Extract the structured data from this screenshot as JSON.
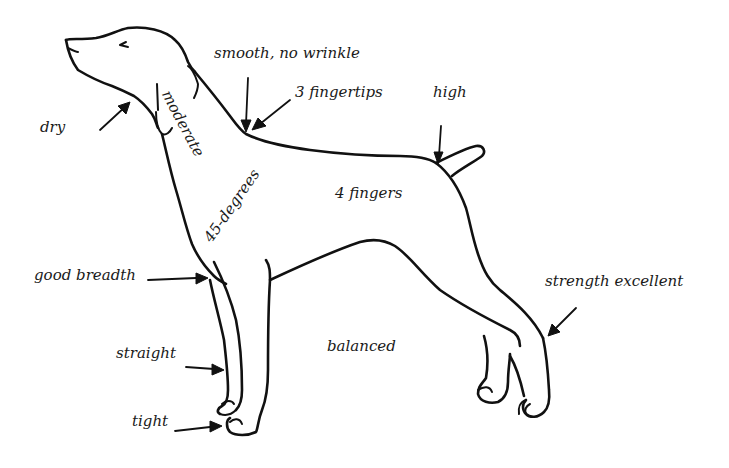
{
  "diagram": {
    "line_color": "#111111",
    "background": "#ffffff",
    "labels": {
      "dry": "dry",
      "moderate": "moderate",
      "smooth_no_wrinkle": "smooth, no wrinkle",
      "three_fingertips": "3 fingertips",
      "high": "high",
      "four_fingers": "4 fingers",
      "forty_five_degrees": "45-degrees",
      "good_breadth": "good breadth",
      "straight": "straight",
      "balanced": "balanced",
      "tight": "tight",
      "strength_excellent": "strength excellent"
    }
  }
}
